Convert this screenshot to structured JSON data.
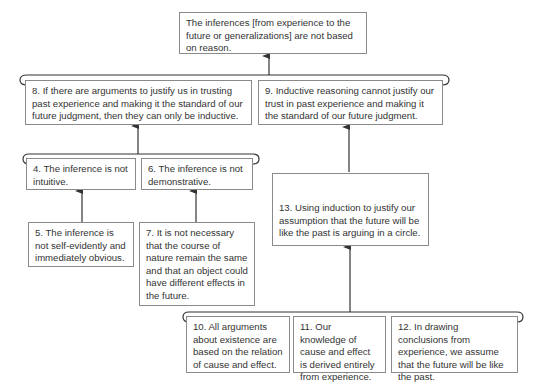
{
  "diagram": {
    "type": "argument-map",
    "conclusion": {
      "id": "c",
      "text": "The inferences [from experience to the future or generalizations] are not based on reason."
    },
    "nodes": [
      {
        "id": "8",
        "text": "8. If there are arguments to justify us in trusting past experience and making it the standard of our future judgment, then they can only be inductive."
      },
      {
        "id": "9",
        "text": "9. Inductive reasoning cannot justify our trust in past experience and making it the standard of our future judgment."
      },
      {
        "id": "4",
        "text": "4. The inference is not intuitive."
      },
      {
        "id": "6",
        "text": "6. The inference is not demonstrative."
      },
      {
        "id": "5",
        "text": "5. The inference is not self-evidently and immediately obvious."
      },
      {
        "id": "7",
        "text": "7. It is not necessary that the course of nature remain the same and that an object could have different effects in the future."
      },
      {
        "id": "13",
        "text": "13. Using induction to justify our assumption that the future will be like the past is arguing in a circle."
      },
      {
        "id": "10",
        "text": "10. All arguments about existence are based on the relation of cause and effect."
      },
      {
        "id": "11",
        "text": "11. Our knowledge of cause and effect is derived entirely from experience."
      },
      {
        "id": "12",
        "text": "12. In drawing conclusions from experience, we assume that the future will be like the past."
      }
    ],
    "edges": [
      {
        "from": [
          "8",
          "9"
        ],
        "to": "c",
        "kind": "linked"
      },
      {
        "from": [
          "4",
          "6"
        ],
        "to": "8",
        "kind": "linked"
      },
      {
        "from": [
          "5"
        ],
        "to": "4",
        "kind": "single"
      },
      {
        "from": [
          "7"
        ],
        "to": "6",
        "kind": "single"
      },
      {
        "from": [
          "13"
        ],
        "to": "9",
        "kind": "single"
      },
      {
        "from": [
          "10",
          "11",
          "12"
        ],
        "to": "13",
        "kind": "linked"
      }
    ],
    "colors": {
      "border": "#8a8a8a",
      "line": "#333333",
      "text": "#333333"
    }
  }
}
